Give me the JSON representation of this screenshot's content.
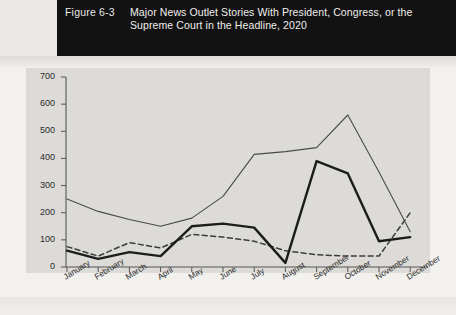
{
  "figure": {
    "number": "Figure 6-3",
    "title": "Major News Outlet Stories With President, Congress, or the Supreme Court in the Headline, 2020"
  },
  "chart_data": {
    "type": "line",
    "title": "Major News Outlet Stories With President, Congress, or the Supreme Court in the Headline, 2020",
    "xlabel": "",
    "ylabel": "",
    "ylim": [
      0,
      700
    ],
    "yticks": [
      0,
      100,
      200,
      300,
      400,
      500,
      600,
      700
    ],
    "grid": false,
    "legend": "none",
    "categories": [
      "January",
      "February",
      "March",
      "April",
      "May",
      "June",
      "July",
      "August",
      "September",
      "October",
      "November",
      "December"
    ],
    "series": [
      {
        "name": "President",
        "style": "thin-solid",
        "color": "#4a4a4a",
        "values": [
          250,
          205,
          175,
          150,
          180,
          260,
          415,
          425,
          440,
          560,
          350,
          130
        ]
      },
      {
        "name": "Congress",
        "style": "dashed",
        "color": "#3c3c3c",
        "values": [
          75,
          40,
          90,
          70,
          120,
          110,
          95,
          60,
          45,
          40,
          40,
          200
        ]
      },
      {
        "name": "Supreme Court",
        "style": "thick-solid",
        "color": "#1c1c1c",
        "values": [
          60,
          30,
          55,
          40,
          150,
          160,
          145,
          15,
          390,
          345,
          95,
          110
        ]
      }
    ]
  },
  "axis": {
    "y_tick_labels": [
      "700",
      "600",
      "500",
      "400",
      "300",
      "200",
      "100",
      "0"
    ],
    "x_tick_labels": [
      "January",
      "February",
      "March",
      "April",
      "May",
      "June",
      "July",
      "August",
      "September",
      "October",
      "November",
      "December"
    ]
  }
}
